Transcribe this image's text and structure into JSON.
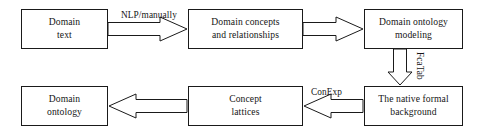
{
  "diagram": {
    "colors": {
      "stroke": "#1a1a1a",
      "fill": "#ffffff",
      "text": "#151515"
    },
    "nodes": [
      {
        "id": "domain-text",
        "label": "Domain\ntext"
      },
      {
        "id": "domain-concepts",
        "label": "Domain concepts\nand relationships"
      },
      {
        "id": "ontology-modeling",
        "label": "Domain ontology\nmodeling"
      },
      {
        "id": "formal-background",
        "label": "The native formal\nbackground"
      },
      {
        "id": "concept-lattices",
        "label": "Concept\nlattices"
      },
      {
        "id": "domain-ontology",
        "label": "Domain\nontology"
      }
    ],
    "edges": [
      {
        "id": "edge-text-to-concepts",
        "from": "domain-text",
        "to": "domain-concepts",
        "label": "NLP/manually",
        "direction": "right",
        "style": "hollow-block-arrow"
      },
      {
        "id": "edge-concepts-to-modeling",
        "from": "domain-concepts",
        "to": "ontology-modeling",
        "label": "",
        "direction": "right",
        "style": "hollow-block-arrow"
      },
      {
        "id": "edge-modeling-to-background",
        "from": "ontology-modeling",
        "to": "formal-background",
        "label": "FcaTab",
        "direction": "down",
        "style": "hollow-block-arrow"
      },
      {
        "id": "edge-background-to-lattices",
        "from": "formal-background",
        "to": "concept-lattices",
        "label": "ConExp",
        "direction": "left",
        "style": "hollow-block-arrow"
      },
      {
        "id": "edge-lattices-to-ontology",
        "from": "concept-lattices",
        "to": "domain-ontology",
        "label": "",
        "direction": "left",
        "style": "hollow-block-arrow"
      }
    ],
    "edge_labels": {
      "nlp_manually": "NLP/manually",
      "fcatab": "FcaTab",
      "conexp": "ConExp"
    }
  }
}
